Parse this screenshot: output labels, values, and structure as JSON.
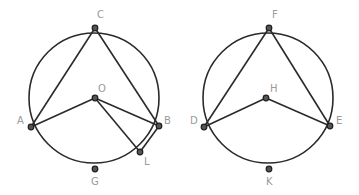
{
  "figures": [
    {
      "name": "left-figure",
      "circle": {
        "cx": 94,
        "cy": 98,
        "r": 65
      },
      "points": {
        "C": {
          "x": 95,
          "y": 28,
          "label": "C",
          "lx": 97,
          "ly": 18
        },
        "O": {
          "x": 95,
          "y": 98,
          "label": "O",
          "lx": 98,
          "ly": 92
        },
        "A": {
          "x": 31,
          "y": 127,
          "label": "A",
          "lx": 17,
          "ly": 124
        },
        "B": {
          "x": 159,
          "y": 126,
          "label": "B",
          "lx": 164,
          "ly": 124
        },
        "L": {
          "x": 140,
          "y": 152,
          "label": "L",
          "lx": 144,
          "ly": 165
        },
        "G": {
          "x": 95,
          "y": 169,
          "label": "G",
          "lx": 91,
          "ly": 185
        }
      },
      "segments": [
        [
          "A",
          "C"
        ],
        [
          "C",
          "B"
        ],
        [
          "A",
          "O"
        ],
        [
          "O",
          "B"
        ],
        [
          "O",
          "L"
        ],
        [
          "L",
          "B"
        ]
      ]
    },
    {
      "name": "right-figure",
      "circle": {
        "cx": 268,
        "cy": 98,
        "r": 65
      },
      "points": {
        "F": {
          "x": 269,
          "y": 28,
          "label": "F",
          "lx": 272,
          "ly": 18
        },
        "H": {
          "x": 266,
          "y": 98,
          "label": "H",
          "lx": 270,
          "ly": 92
        },
        "D": {
          "x": 204,
          "y": 127,
          "label": "D",
          "lx": 190,
          "ly": 124
        },
        "E": {
          "x": 330,
          "y": 126,
          "label": "E",
          "lx": 336,
          "ly": 124
        },
        "K": {
          "x": 269,
          "y": 169,
          "label": "K",
          "lx": 266,
          "ly": 185
        }
      },
      "segments": [
        [
          "D",
          "F"
        ],
        [
          "F",
          "E"
        ],
        [
          "D",
          "H"
        ],
        [
          "H",
          "E"
        ]
      ]
    }
  ],
  "colors": {
    "line": "#2a2a2a",
    "point_fill": "#555555",
    "label": "#9a9a9a",
    "background": "#ffffff"
  }
}
